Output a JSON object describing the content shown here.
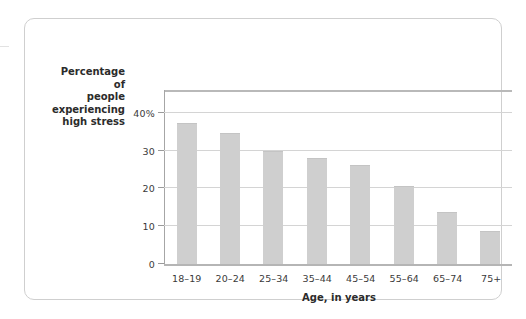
{
  "chart_data": {
    "type": "bar",
    "title": "",
    "xlabel": "Age, in years",
    "ylabel": "Percentage of people experiencing high stress",
    "ylabel_lines": [
      "Percentage of",
      "people",
      "experiencing",
      "high stress"
    ],
    "categories": [
      "18–19",
      "20–24",
      "25–34",
      "35–44",
      "45–54",
      "55–64",
      "65–74",
      "75+"
    ],
    "values": [
      37.3,
      34.7,
      29.8,
      28.0,
      26.3,
      20.7,
      13.8,
      8.7
    ],
    "ylim": [
      0,
      46
    ],
    "yticks": [
      0,
      10,
      20,
      30,
      40
    ],
    "ytick_labels": [
      "0",
      "10",
      "20",
      "30",
      "40%"
    ],
    "grid": true,
    "legend": "none",
    "bar_color": "#cfcfcf",
    "axis_color": "#b5b5b5",
    "grid_color": "#d4d4d4",
    "text_color": "#2b2b2b"
  }
}
